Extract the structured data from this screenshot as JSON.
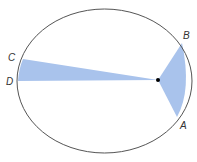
{
  "diagram": {
    "type": "kepler-second-law-orbit",
    "colors": {
      "orbit_stroke": "#555555",
      "sector_fill": "#a9c3ec",
      "sun": "#000000",
      "background": "#ffffff"
    },
    "labels": {
      "A": "A",
      "B": "B",
      "C": "C",
      "D": "D"
    }
  }
}
